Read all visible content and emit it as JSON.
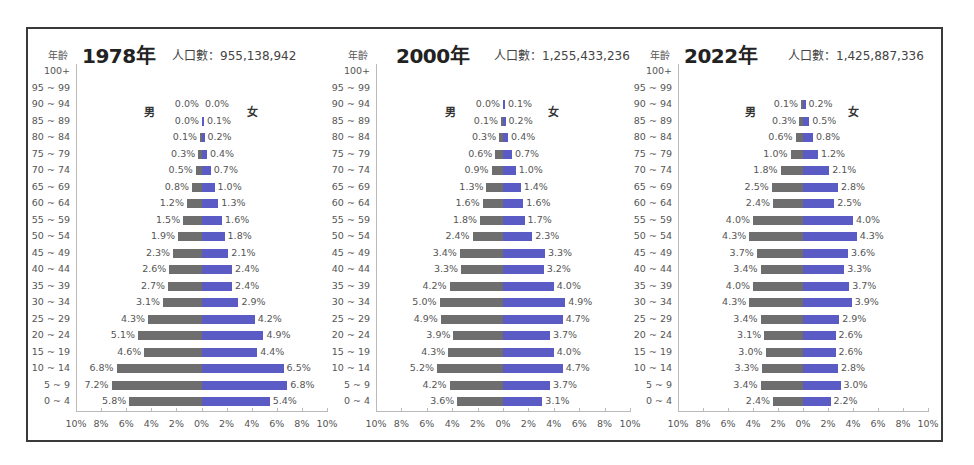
{
  "chart_data": [
    {
      "type": "bar",
      "subtype": "population-pyramid",
      "title": "1978年",
      "population_label": "人口數：955,138,942",
      "age_axis_label": "年齡",
      "male_label": "男",
      "female_label": "女",
      "categories": [
        "100+",
        "95 ~ 99",
        "90 ~ 94",
        "85 ~ 89",
        "80 ~ 84",
        "75 ~ 79",
        "70 ~ 74",
        "65 ~ 69",
        "60 ~ 64",
        "55 ~ 59",
        "50 ~ 54",
        "45 ~ 49",
        "40 ~ 44",
        "35 ~ 39",
        "30 ~ 34",
        "25 ~ 29",
        "20 ~ 24",
        "15 ~ 19",
        "10 ~ 14",
        "5 ~ 9",
        "0 ~ 4"
      ],
      "series": [
        {
          "name": "男",
          "color": "#6e6e6e",
          "values": [
            null,
            null,
            0.0,
            0.0,
            0.1,
            0.3,
            0.5,
            0.8,
            1.2,
            1.5,
            1.9,
            2.3,
            2.6,
            2.7,
            3.1,
            4.3,
            5.1,
            4.6,
            6.8,
            7.2,
            5.8
          ]
        },
        {
          "name": "女",
          "color": "#5b5bc6",
          "values": [
            null,
            null,
            0.0,
            0.1,
            0.2,
            0.4,
            0.7,
            1.0,
            1.3,
            1.6,
            1.8,
            2.1,
            2.4,
            2.4,
            2.9,
            4.2,
            4.9,
            4.4,
            6.5,
            6.8,
            5.4
          ]
        }
      ],
      "xticks": [
        "10%",
        "8%",
        "6%",
        "4%",
        "2%",
        "0%",
        "2%",
        "4%",
        "6%",
        "8%",
        "10%"
      ],
      "xlim": [
        -10,
        10
      ],
      "grid": false
    },
    {
      "type": "bar",
      "subtype": "population-pyramid",
      "title": "2000年",
      "population_label": "人口數：1,255,433,236",
      "age_axis_label": "年齡",
      "male_label": "男",
      "female_label": "女",
      "categories": [
        "100+",
        "95 ~ 99",
        "90 ~ 94",
        "85 ~ 89",
        "80 ~ 84",
        "75 ~ 79",
        "70 ~ 74",
        "65 ~ 69",
        "60 ~ 64",
        "55 ~ 59",
        "50 ~ 54",
        "45 ~ 49",
        "40 ~ 44",
        "35 ~ 39",
        "30 ~ 34",
        "25 ~ 29",
        "20 ~ 24",
        "15 ~ 19",
        "10 ~ 14",
        "5 ~ 9",
        "0 ~ 4"
      ],
      "series": [
        {
          "name": "男",
          "color": "#6e6e6e",
          "values": [
            null,
            null,
            0.0,
            0.1,
            0.3,
            0.6,
            0.9,
            1.3,
            1.6,
            1.8,
            2.4,
            3.4,
            3.3,
            4.2,
            5.0,
            4.9,
            3.9,
            4.3,
            5.2,
            4.2,
            3.6
          ]
        },
        {
          "name": "女",
          "color": "#5b5bc6",
          "values": [
            null,
            null,
            0.1,
            0.2,
            0.4,
            0.7,
            1.0,
            1.4,
            1.6,
            1.7,
            2.3,
            3.3,
            3.2,
            4.0,
            4.9,
            4.7,
            3.7,
            4.0,
            4.7,
            3.7,
            3.1
          ]
        }
      ],
      "xticks": [
        "10%",
        "8%",
        "6%",
        "4%",
        "2%",
        "0%",
        "2%",
        "4%",
        "6%",
        "8%",
        "10%"
      ],
      "xlim": [
        -10,
        10
      ],
      "grid": false
    },
    {
      "type": "bar",
      "subtype": "population-pyramid",
      "title": "2022年",
      "population_label": "人口數：1,425,887,336",
      "age_axis_label": "年齡",
      "male_label": "男",
      "female_label": "女",
      "categories": [
        "100+",
        "95 ~ 99",
        "90 ~ 94",
        "85 ~ 89",
        "80 ~ 84",
        "75 ~ 79",
        "70 ~ 74",
        "65 ~ 69",
        "60 ~ 64",
        "55 ~ 59",
        "50 ~ 54",
        "45 ~ 49",
        "40 ~ 44",
        "35 ~ 39",
        "30 ~ 34",
        "25 ~ 29",
        "20 ~ 24",
        "15 ~ 19",
        "10 ~ 14",
        "5 ~ 9",
        "0 ~ 4"
      ],
      "series": [
        {
          "name": "男",
          "color": "#6e6e6e",
          "values": [
            null,
            null,
            0.1,
            0.3,
            0.6,
            1.0,
            1.8,
            2.5,
            2.4,
            4.0,
            4.3,
            3.7,
            3.4,
            4.0,
            4.3,
            3.4,
            3.1,
            3.0,
            3.3,
            3.4,
            2.4
          ]
        },
        {
          "name": "女",
          "color": "#5b5bc6",
          "values": [
            null,
            null,
            0.2,
            0.5,
            0.8,
            1.2,
            2.1,
            2.8,
            2.5,
            4.0,
            4.3,
            3.6,
            3.3,
            3.7,
            3.9,
            2.9,
            2.6,
            2.6,
            2.8,
            3.0,
            2.2
          ]
        }
      ],
      "xticks": [
        "10%",
        "8%",
        "6%",
        "4%",
        "2%",
        "0%",
        "2%",
        "4%",
        "6%",
        "8%",
        "10%"
      ],
      "xlim": [
        -10,
        10
      ],
      "grid": false
    }
  ]
}
